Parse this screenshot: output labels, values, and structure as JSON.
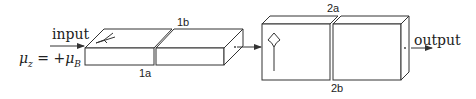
{
  "diagram": {
    "input_label": "input",
    "output_label": "output",
    "equation": {
      "lhs_symbol": "μ",
      "lhs_sub": "z",
      "relation": " = +",
      "rhs_symbol": "μ",
      "rhs_sub": "B"
    },
    "block1": {
      "label_top": "1b",
      "label_bottom": "1a",
      "orientation": "horizontal slab",
      "glyph": "bent-arrow-lying"
    },
    "block2": {
      "label_top": "2a",
      "label_bottom": "2b",
      "orientation": "vertical block",
      "glyph": "up-arrow-spread"
    },
    "colors": {
      "stroke": "#333333",
      "text": "#222222",
      "background": "#ffffff"
    }
  }
}
